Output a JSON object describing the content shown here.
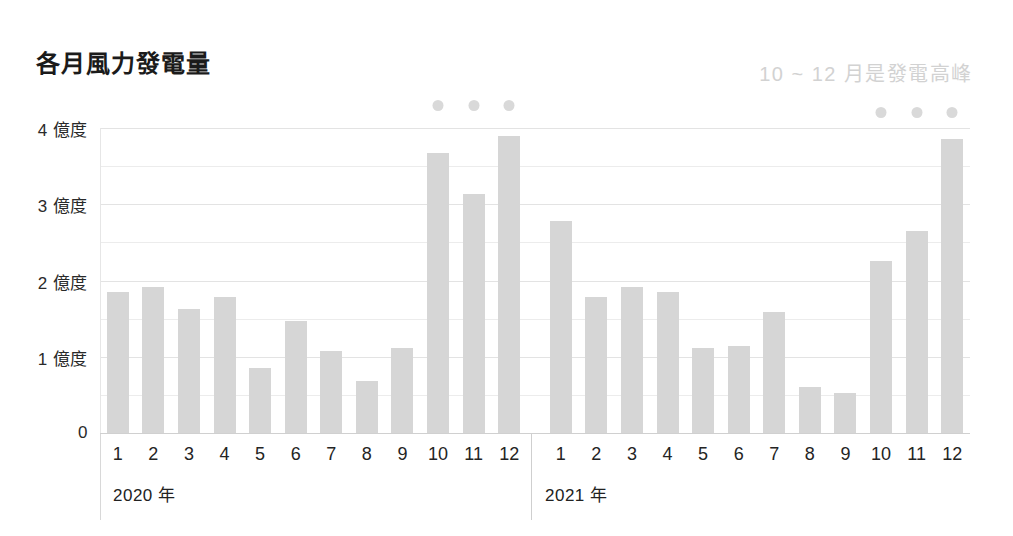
{
  "header": {
    "title": "各月風力發電量",
    "subtitle": "10 ~ 12 月是發電高峰"
  },
  "chart_data": {
    "type": "bar",
    "title": "各月風力發電量",
    "subtitle": "10 ~ 12 月是發電高峰",
    "xlabel": "",
    "ylabel": "億度",
    "ylim": [
      0,
      4
    ],
    "grid": true,
    "legend_position": "none",
    "ytick_labels": [
      "4 億度",
      "3 億度",
      "2 億度",
      "1 億度",
      "0"
    ],
    "ytick_values": [
      4,
      3,
      2,
      1,
      0
    ],
    "gridline_values": [
      0.5,
      1,
      1.5,
      2,
      2.5,
      3,
      3.5,
      4
    ],
    "group_labels": [
      "2020 年",
      "2021 年"
    ],
    "categories": [
      "1",
      "2",
      "3",
      "4",
      "5",
      "6",
      "7",
      "8",
      "9",
      "10",
      "11",
      "12"
    ],
    "series": [
      {
        "name": "2020 年",
        "values": [
          1.85,
          1.91,
          1.62,
          1.78,
          0.85,
          1.47,
          1.07,
          0.68,
          1.11,
          3.67,
          3.13,
          3.89
        ]
      },
      {
        "name": "2021 年",
        "values": [
          2.78,
          1.79,
          1.92,
          1.85,
          1.11,
          1.14,
          1.59,
          0.6,
          0.52,
          2.25,
          2.65,
          3.85
        ]
      }
    ],
    "annotations": [
      {
        "series": "2020 年",
        "category": "10",
        "marker": "dot"
      },
      {
        "series": "2020 年",
        "category": "11",
        "marker": "dot"
      },
      {
        "series": "2020 年",
        "category": "12",
        "marker": "dot"
      },
      {
        "series": "2021 年",
        "category": "10",
        "marker": "dot"
      },
      {
        "series": "2021 年",
        "category": "11",
        "marker": "dot"
      },
      {
        "series": "2021 年",
        "category": "12",
        "marker": "dot"
      }
    ],
    "colors": {
      "bar": "#d6d6d6",
      "dot": "#d9d9d9",
      "grid": "#ececec",
      "title": "#1b1b1b",
      "subtitle": "#d2d2d2",
      "background": "#ffffff"
    }
  }
}
